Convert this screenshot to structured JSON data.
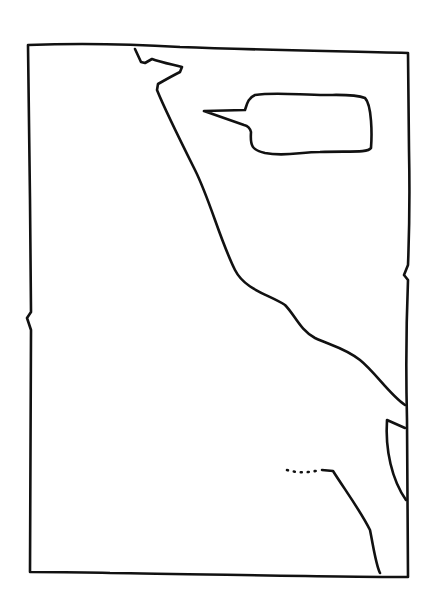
{
  "drawing": {
    "description": "Hand-drawn comic panel sketch with an empty speech bubble",
    "colors": {
      "background": "#ffffff",
      "ink": "#111111"
    },
    "panel": {
      "text": ""
    },
    "speech_bubble": {
      "text": ""
    }
  }
}
